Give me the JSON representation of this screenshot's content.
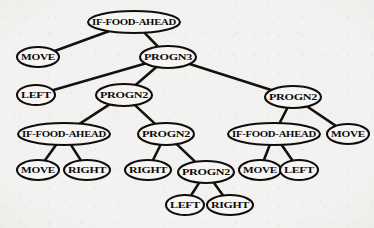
{
  "diagram": {
    "background_color": "#f3f2f0",
    "node_fill": "#f7f6f4",
    "node_stroke": "#100e0c",
    "edge_color": "#141210",
    "width": 374,
    "height": 228
  },
  "nodes": [
    {
      "id": "n0",
      "label": "IF-FOOD-AHEAD",
      "x": 134,
      "y": 22,
      "rx": 46,
      "ry": 11,
      "font_size": 7.6
    },
    {
      "id": "n1",
      "label": "MOVE",
      "x": 38,
      "y": 57,
      "rx": 21,
      "ry": 10,
      "font_size": 7.6
    },
    {
      "id": "n2",
      "label": "PROGN3",
      "x": 168,
      "y": 57,
      "rx": 28,
      "ry": 11,
      "font_size": 7.6
    },
    {
      "id": "n3",
      "label": "LEFT",
      "x": 36,
      "y": 95,
      "rx": 19,
      "ry": 10,
      "font_size": 7.6
    },
    {
      "id": "n4",
      "label": "PROGN2",
      "x": 124,
      "y": 95,
      "rx": 28,
      "ry": 11,
      "font_size": 7.6
    },
    {
      "id": "n5",
      "label": "PROGN2",
      "x": 293,
      "y": 97,
      "rx": 28,
      "ry": 11,
      "font_size": 7.6
    },
    {
      "id": "n6",
      "label": "IF-FOOD-AHEAD",
      "x": 64,
      "y": 134,
      "rx": 46,
      "ry": 11,
      "font_size": 7.6
    },
    {
      "id": "n7",
      "label": "PROGN2",
      "x": 166,
      "y": 134,
      "rx": 28,
      "ry": 11,
      "font_size": 7.6
    },
    {
      "id": "n8",
      "label": "IF-FOOD-AHEAD",
      "x": 274,
      "y": 134,
      "rx": 46,
      "ry": 11,
      "font_size": 7.6
    },
    {
      "id": "n9",
      "label": "MOVE",
      "x": 348,
      "y": 134,
      "rx": 21,
      "ry": 10,
      "font_size": 7.6
    },
    {
      "id": "n10",
      "label": "MOVE",
      "x": 38,
      "y": 170,
      "rx": 21,
      "ry": 10,
      "font_size": 7.6
    },
    {
      "id": "n11",
      "label": "RIGHT",
      "x": 87,
      "y": 170,
      "rx": 23,
      "ry": 10,
      "font_size": 7.6
    },
    {
      "id": "n12",
      "label": "RIGHT",
      "x": 148,
      "y": 170,
      "rx": 23,
      "ry": 10,
      "font_size": 7.6
    },
    {
      "id": "n13",
      "label": "PROGN2",
      "x": 206,
      "y": 172,
      "rx": 28,
      "ry": 11,
      "font_size": 7.6
    },
    {
      "id": "n14",
      "label": "MOVE",
      "x": 260,
      "y": 170,
      "rx": 21,
      "ry": 10,
      "font_size": 7.6
    },
    {
      "id": "n15",
      "label": "LEFT",
      "x": 299,
      "y": 170,
      "rx": 19,
      "ry": 10,
      "font_size": 7.6
    },
    {
      "id": "n16",
      "label": "LEFT",
      "x": 185,
      "y": 205,
      "rx": 19,
      "ry": 10,
      "font_size": 7.6
    },
    {
      "id": "n17",
      "label": "RIGHT",
      "x": 230,
      "y": 205,
      "rx": 23,
      "ry": 10,
      "font_size": 7.6
    }
  ],
  "edges": [
    {
      "from": "n0",
      "to": "n1"
    },
    {
      "from": "n0",
      "to": "n2"
    },
    {
      "from": "n2",
      "to": "n3"
    },
    {
      "from": "n2",
      "to": "n4"
    },
    {
      "from": "n2",
      "to": "n5"
    },
    {
      "from": "n4",
      "to": "n6"
    },
    {
      "from": "n4",
      "to": "n7"
    },
    {
      "from": "n5",
      "to": "n8"
    },
    {
      "from": "n5",
      "to": "n9"
    },
    {
      "from": "n6",
      "to": "n10"
    },
    {
      "from": "n6",
      "to": "n11"
    },
    {
      "from": "n7",
      "to": "n12"
    },
    {
      "from": "n7",
      "to": "n13"
    },
    {
      "from": "n8",
      "to": "n14"
    },
    {
      "from": "n8",
      "to": "n15"
    },
    {
      "from": "n13",
      "to": "n16"
    },
    {
      "from": "n13",
      "to": "n17"
    }
  ]
}
